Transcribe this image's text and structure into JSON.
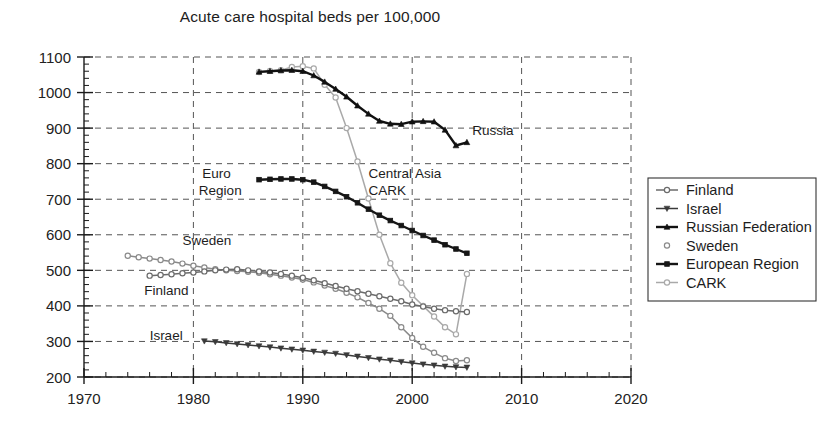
{
  "chart_data": {
    "type": "line",
    "title": "Acute care hospital beds per 100,000",
    "xlabel": "",
    "ylabel": "",
    "xlim": [
      1970,
      2020
    ],
    "ylim": [
      200,
      1100
    ],
    "xticks": [
      1970,
      1980,
      1990,
      2000,
      2010,
      2020
    ],
    "yticks": [
      200,
      300,
      400,
      500,
      600,
      700,
      800,
      900,
      1000,
      1100
    ],
    "grid": true,
    "minor_ticks": true,
    "legend_position": "right",
    "series": [
      {
        "name": "Finland",
        "color": "#6b6b6b",
        "marker": "circle-open",
        "x": [
          1976,
          1977,
          1978,
          1979,
          1980,
          1981,
          1982,
          1983,
          1984,
          1985,
          1986,
          1987,
          1988,
          1989,
          1990,
          1991,
          1992,
          1993,
          1994,
          1995,
          1996,
          1997,
          1998,
          1999,
          2000,
          2001,
          2002,
          2003,
          2004,
          2005
        ],
        "y": [
          485,
          487,
          489,
          492,
          494,
          497,
          500,
          502,
          503,
          500,
          497,
          494,
          490,
          485,
          479,
          472,
          464,
          456,
          448,
          441,
          434,
          427,
          420,
          413,
          404,
          398,
          392,
          388,
          385,
          383
        ]
      },
      {
        "name": "Israel",
        "color": "#3a3a3a",
        "marker": "triangle-down",
        "x": [
          1981,
          1982,
          1983,
          1984,
          1985,
          1986,
          1987,
          1988,
          1989,
          1990,
          1991,
          1992,
          1993,
          1994,
          1995,
          1996,
          1997,
          1998,
          1999,
          2000,
          2001,
          2002,
          2003,
          2004,
          2005
        ],
        "y": [
          301,
          299,
          296,
          293,
          290,
          287,
          284,
          281,
          278,
          275,
          272,
          269,
          266,
          262,
          258,
          254,
          250,
          247,
          243,
          239,
          236,
          233,
          230,
          228,
          227
        ]
      },
      {
        "name": "Russian Federation",
        "color": "#111111",
        "marker": "triangle-up",
        "x": [
          1986,
          1987,
          1988,
          1989,
          1990,
          1991,
          1992,
          1993,
          1994,
          1995,
          1996,
          1997,
          1998,
          1999,
          2000,
          2001,
          2002,
          2003,
          2004,
          2005
        ],
        "y": [
          1058,
          1060,
          1062,
          1063,
          1060,
          1048,
          1030,
          1010,
          988,
          963,
          940,
          920,
          912,
          911,
          918,
          919,
          918,
          895,
          851,
          860
        ]
      },
      {
        "name": "Sweden",
        "color": "#8a8a8a",
        "marker": "circle-open",
        "x": [
          1974,
          1975,
          1976,
          1977,
          1978,
          1979,
          1980,
          1981,
          1982,
          1983,
          1984,
          1985,
          1986,
          1987,
          1988,
          1989,
          1990,
          1991,
          1992,
          1993,
          1994,
          1995,
          1996,
          1997,
          1998,
          1999,
          2000,
          2001,
          2002,
          2003,
          2004,
          2005
        ],
        "y": [
          541,
          537,
          533,
          529,
          525,
          519,
          513,
          508,
          503,
          500,
          498,
          496,
          493,
          489,
          485,
          480,
          474,
          466,
          457,
          448,
          437,
          424,
          408,
          392,
          372,
          340,
          310,
          285,
          268,
          253,
          245,
          247
        ]
      },
      {
        "name": "European Region",
        "color": "#161616",
        "marker": "square",
        "x": [
          1986,
          1987,
          1988,
          1989,
          1990,
          1991,
          1992,
          1993,
          1994,
          1995,
          1996,
          1997,
          1998,
          1999,
          2000,
          2001,
          2002,
          2003,
          2004,
          2005
        ],
        "y": [
          755,
          756,
          757,
          757,
          755,
          748,
          736,
          722,
          707,
          690,
          672,
          655,
          640,
          626,
          612,
          598,
          585,
          572,
          560,
          548
        ]
      },
      {
        "name": "CARK",
        "color": "#a9a9a9",
        "marker": "circle-open",
        "x": [
          1986,
          1987,
          1988,
          1989,
          1990,
          1991,
          1992,
          1993,
          1994,
          1995,
          1996,
          1997,
          1998,
          1999,
          2000,
          2001,
          2002,
          2003,
          2004,
          2005
        ],
        "y": [
          1058,
          1061,
          1063,
          1072,
          1074,
          1068,
          1022,
          986,
          900,
          806,
          702,
          600,
          520,
          465,
          430,
          400,
          370,
          340,
          320,
          490
        ]
      }
    ],
    "annotations": [
      {
        "text": "Russia",
        "x": 2005.5,
        "y": 880,
        "name": "annotation-russia"
      },
      {
        "text": "Central Asia",
        "x": 1996.0,
        "y": 760,
        "name": "annotation-central-asia"
      },
      {
        "text": "CARK",
        "x": 1996.0,
        "y": 712,
        "name": "annotation-cark"
      },
      {
        "text": "Euro",
        "x": 1980.8,
        "y": 760,
        "name": "annotation-euro"
      },
      {
        "text": "Region",
        "x": 1980.5,
        "y": 712,
        "name": "annotation-region"
      },
      {
        "text": "Sweden",
        "x": 1979.0,
        "y": 570,
        "name": "annotation-sweden"
      },
      {
        "text": "Finland",
        "x": 1975.5,
        "y": 430,
        "name": "annotation-finland"
      },
      {
        "text": "Israel",
        "x": 1976.0,
        "y": 303,
        "name": "annotation-israel"
      }
    ]
  },
  "legend": {
    "entries": [
      {
        "label": "Finland",
        "color": "#6b6b6b",
        "marker": "circle-open"
      },
      {
        "label": "Israel",
        "color": "#3a3a3a",
        "marker": "triangle-down"
      },
      {
        "label": "Russian Federation",
        "color": "#111111",
        "marker": "triangle-up"
      },
      {
        "label": "Sweden",
        "color": "#8a8a8a",
        "marker": "circle-open"
      },
      {
        "label": "European Region",
        "color": "#161616",
        "marker": "square"
      },
      {
        "label": "CARK",
        "color": "#a9a9a9",
        "marker": "circle-open"
      }
    ]
  }
}
